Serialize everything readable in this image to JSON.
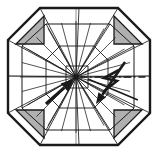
{
  "figure": {
    "type": "technical-line-drawing",
    "background_color": "#ffffff",
    "line_color": "#1a1a1a",
    "faint_line_color": "#9a9a9a",
    "shade_fill_color": "#b0b0b0",
    "canvas": {
      "width": 159,
      "height": 154
    },
    "hub": {
      "x": 76,
      "y": 77,
      "label": ""
    },
    "octagon_outline": {
      "name": "octagon-outline",
      "points": "40,8 118,8 150,40 150,113 118,145 40,145 8,113 8,40",
      "stroke_width": 2.4
    },
    "inner_octagon": {
      "name": "inner-octagon",
      "points": "46,24 110,24 134,46 134,108 110,130 46,130 22,108 22,46",
      "stroke_width": 1.0
    },
    "mid_ring": {
      "name": "mid-ring-octagon",
      "points": "60,46 94,46 108,60 108,94 94,108 60,108 46,94 46,60",
      "stroke_width": 0.9
    },
    "hub_ring": {
      "name": "hub-ring-square",
      "points": "66,66 88,66 88,88 66,88",
      "stroke_width": 0.9
    },
    "shaded_corners": [
      {
        "name": "shaded-corner-top-left",
        "points": "16,44 44,16 44,44"
      },
      {
        "name": "shaded-corner-top-right",
        "points": "114,16 142,44 114,44"
      },
      {
        "name": "shaded-corner-bottom-left",
        "points": "16,110 44,110 44,138"
      },
      {
        "name": "shaded-corner-bottom-right",
        "points": "114,110 142,110 114,138"
      }
    ],
    "panel_seams": [
      "40,8 76,77",
      "118,8 76,77",
      "150,40 76,77",
      "150,113 76,77",
      "118,145 76,77",
      "40,145 76,77",
      "8,113 76,77",
      "8,40 76,77",
      "79,8 76,77",
      "150,76 76,77",
      "79,145 76,77",
      "8,76 76,77",
      "46,24 76,77",
      "110,24 76,77",
      "134,46 76,77",
      "134,108 76,77",
      "110,130 76,77",
      "46,130 76,77",
      "22,108 76,77",
      "22,46 76,77"
    ],
    "radial_spokes_count": 24,
    "faint_axes": [
      {
        "name": "horizontal-axis",
        "x1": 8,
        "y1": 76,
        "x2": 150,
        "y2": 76
      },
      {
        "name": "vertical-axis",
        "x1": 76,
        "y1": 8,
        "x2": 76,
        "y2": 145
      }
    ],
    "dash_dot_axis": {
      "name": "dash-dot-axis-line",
      "x1": 80,
      "y1": 77,
      "x2": 147,
      "y2": 77,
      "dash_pattern": "7 3 1.6 3"
    },
    "solid_arrow_to_hub": {
      "name": "incidence-arrow",
      "tail": {
        "x": 46,
        "y": 104
      },
      "head": {
        "x": 74,
        "y": 79
      }
    },
    "diagonal_arrow": {
      "name": "reflection-arrow",
      "tail": {
        "x": 125,
        "y": 62
      },
      "head": {
        "x": 96,
        "y": 104
      }
    },
    "cross_diagonal_arrow": {
      "name": "cross-diagonal-arrow",
      "tail": {
        "x": 88,
        "y": 79
      },
      "head": {
        "x": 138,
        "y": 100
      }
    },
    "zigzag_symbol": {
      "name": "lightning-zigzag-symbol",
      "points": "119,70 104,78 117,81 103,92",
      "stroke_width": 2.6
    }
  }
}
